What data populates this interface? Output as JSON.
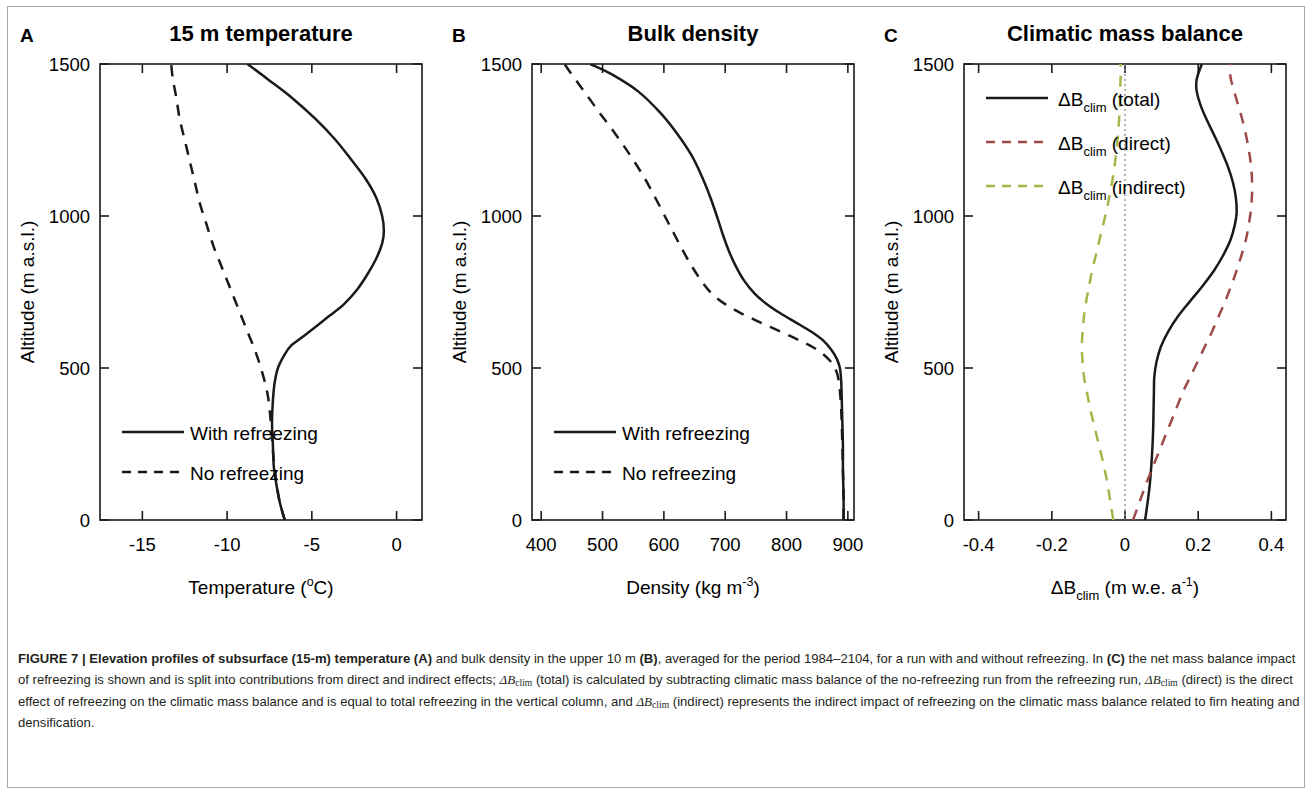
{
  "figure": {
    "label": "FIGURE 7",
    "separator": "|",
    "caption_bold": "Elevation profiles of subsurface (15-m) temperature (A)",
    "caption_rest_1": " and bulk density in the upper 10 m ",
    "caption_b_tag": "(B)",
    "caption_rest_2": ", averaged for the period 1984–2104, for a run with and without refreezing. In ",
    "caption_c_tag": "(C)",
    "caption_rest_3": " the net mass balance impact of refreezing is shown and is split into contributions from direct and indirect effects; ",
    "caption_sym_1": "ΔB",
    "caption_sub_1": "clim",
    "caption_rest_4": " (total) is calculated by subtracting climatic mass balance of the no-refreezing run from the refreezing run, ",
    "caption_sym_2": "ΔB",
    "caption_sub_2": "clim",
    "caption_rest_5": " (direct) is the direct effect of refreezing on the climatic mass balance and is equal to total refreezing in the vertical column, and ",
    "caption_sym_3": "ΔB",
    "caption_sub_3": "clim",
    "caption_rest_6": " (indirect) represents the indirect impact of refreezing on the climatic mass balance related to firn heating and densification."
  },
  "colors": {
    "curve_black": "#1a1a1a",
    "curve_red": "#9e4a4a",
    "curve_green": "#a8b44a",
    "zero_line": "#8c8c8c",
    "axis": "#1a1a1a",
    "border": "#a9a9a9"
  },
  "shared": {
    "ylabel": "Altitude (m a.s.l.)",
    "yticks": [
      0,
      500,
      1000,
      1500
    ],
    "ylim": [
      0,
      1500
    ]
  },
  "chart_data": [
    {
      "panel_letter": "A",
      "type": "line",
      "title": "15 m temperature",
      "xlabel": "Temperature (",
      "xlabel_sup": "o",
      "xlabel_tail": "C)",
      "ylabel": "Altitude (m a.s.l.)",
      "xlim": [
        -17.5,
        1.5
      ],
      "ylim": [
        0,
        1500
      ],
      "xticks": [
        -15,
        -10,
        -5,
        0
      ],
      "xtick_labels": [
        "-15",
        "-10",
        "-5",
        "0"
      ],
      "ylabel_ticks": [
        0,
        500,
        1000,
        1500
      ],
      "grid": false,
      "legend_position": "lower-left",
      "series": [
        {
          "name": "With refreezing",
          "style": "solid",
          "color": "#1a1a1a",
          "points": [
            [
              -6.6,
              0
            ],
            [
              -6.9,
              60
            ],
            [
              -7.1,
              120
            ],
            [
              -7.25,
              180
            ],
            [
              -7.3,
              250
            ],
            [
              -7.35,
              320
            ],
            [
              -7.3,
              390
            ],
            [
              -7.2,
              450
            ],
            [
              -7.0,
              500
            ],
            [
              -6.6,
              545
            ],
            [
              -6.2,
              575
            ],
            [
              -5.6,
              600
            ],
            [
              -4.9,
              630
            ],
            [
              -4.0,
              670
            ],
            [
              -3.1,
              710
            ],
            [
              -2.3,
              760
            ],
            [
              -1.7,
              810
            ],
            [
              -1.2,
              860
            ],
            [
              -0.85,
              910
            ],
            [
              -0.75,
              950
            ],
            [
              -0.85,
              1000
            ],
            [
              -1.2,
              1060
            ],
            [
              -1.8,
              1120
            ],
            [
              -2.6,
              1180
            ],
            [
              -3.6,
              1250
            ],
            [
              -4.8,
              1320
            ],
            [
              -6.2,
              1390
            ],
            [
              -7.6,
              1450
            ],
            [
              -8.8,
              1500
            ]
          ]
        },
        {
          "name": "No refreezing",
          "style": "dashed",
          "color": "#1a1a1a",
          "points": [
            [
              -6.6,
              0
            ],
            [
              -6.9,
              60
            ],
            [
              -7.1,
              130
            ],
            [
              -7.25,
              200
            ],
            [
              -7.35,
              270
            ],
            [
              -7.45,
              340
            ],
            [
              -7.6,
              410
            ],
            [
              -7.9,
              480
            ],
            [
              -8.3,
              550
            ],
            [
              -8.8,
              620
            ],
            [
              -9.3,
              690
            ],
            [
              -9.8,
              760
            ],
            [
              -10.3,
              830
            ],
            [
              -10.8,
              900
            ],
            [
              -11.2,
              970
            ],
            [
              -11.6,
              1040
            ],
            [
              -11.9,
              1110
            ],
            [
              -12.2,
              1180
            ],
            [
              -12.5,
              1250
            ],
            [
              -12.8,
              1320
            ],
            [
              -13.0,
              1390
            ],
            [
              -13.2,
              1450
            ],
            [
              -13.3,
              1500
            ]
          ]
        }
      ],
      "legend": [
        {
          "label": "With refreezing",
          "style": "solid"
        },
        {
          "label": "No refreezing",
          "style": "dashed"
        }
      ]
    },
    {
      "panel_letter": "B",
      "type": "line",
      "title": "Bulk density",
      "xlabel": "Density (kg m",
      "xlabel_sup": "-3",
      "xlabel_tail": ")",
      "ylabel": "Altitude (m a.s.l.)",
      "xlim": [
        385,
        910
      ],
      "ylim": [
        0,
        1500
      ],
      "xticks": [
        400,
        500,
        600,
        700,
        800,
        900
      ],
      "xtick_labels": [
        "400",
        "500",
        "600",
        "700",
        "800",
        "900"
      ],
      "grid": false,
      "legend_position": "lower-left",
      "series": [
        {
          "name": "With refreezing",
          "style": "solid",
          "color": "#1a1a1a",
          "points": [
            [
              893,
              0
            ],
            [
              893,
              80
            ],
            [
              892,
              160
            ],
            [
              892,
              240
            ],
            [
              891,
              320
            ],
            [
              890,
              400
            ],
            [
              889,
              460
            ],
            [
              887,
              500
            ],
            [
              882,
              530
            ],
            [
              873,
              560
            ],
            [
              860,
              590
            ],
            [
              840,
              620
            ],
            [
              815,
              650
            ],
            [
              790,
              680
            ],
            [
              768,
              710
            ],
            [
              748,
              745
            ],
            [
              730,
              790
            ],
            [
              716,
              840
            ],
            [
              705,
              890
            ],
            [
              696,
              940
            ],
            [
              688,
              990
            ],
            [
              676,
              1060
            ],
            [
              662,
              1130
            ],
            [
              645,
              1200
            ],
            [
              622,
              1270
            ],
            [
              594,
              1340
            ],
            [
              558,
              1410
            ],
            [
              516,
              1465
            ],
            [
              480,
              1500
            ]
          ]
        },
        {
          "name": "No refreezing",
          "style": "dashed",
          "color": "#1a1a1a",
          "points": [
            [
              893,
              0
            ],
            [
              893,
              80
            ],
            [
              892,
              160
            ],
            [
              891,
              240
            ],
            [
              890,
              320
            ],
            [
              888,
              400
            ],
            [
              885,
              460
            ],
            [
              879,
              500
            ],
            [
              868,
              530
            ],
            [
              850,
              560
            ],
            [
              822,
              590
            ],
            [
              790,
              620
            ],
            [
              757,
              650
            ],
            [
              726,
              680
            ],
            [
              700,
              710
            ],
            [
              678,
              745
            ],
            [
              660,
              790
            ],
            [
              644,
              840
            ],
            [
              630,
              890
            ],
            [
              617,
              940
            ],
            [
              604,
              990
            ],
            [
              586,
              1060
            ],
            [
              567,
              1130
            ],
            [
              545,
              1200
            ],
            [
              521,
              1270
            ],
            [
              495,
              1340
            ],
            [
              470,
              1410
            ],
            [
              450,
              1465
            ],
            [
              438,
              1500
            ]
          ]
        }
      ],
      "legend": [
        {
          "label": "With refreezing",
          "style": "solid"
        },
        {
          "label": "No refreezing",
          "style": "dashed"
        }
      ]
    },
    {
      "panel_letter": "C",
      "type": "line",
      "title": "Climatic mass balance",
      "xlabel_sym": "ΔB",
      "xlabel_sub": "clim",
      "xlabel_unit": " (m w.e. a",
      "xlabel_sup": "-1",
      "xlabel_tail": ")",
      "ylabel": "Altitude (m a.s.l.)",
      "xlim": [
        -0.44,
        0.44
      ],
      "ylim": [
        0,
        1500
      ],
      "xticks": [
        -0.4,
        -0.2,
        0,
        0.2,
        0.4
      ],
      "xtick_labels": [
        "-0.4",
        "-0.2",
        "0",
        "0.2",
        "0.4"
      ],
      "grid": false,
      "zero_line": 0,
      "legend_position": "upper-left",
      "series": [
        {
          "name": "ΔBclim (total)",
          "style": "solid",
          "color": "#1a1a1a",
          "points": [
            [
              0.055,
              0
            ],
            [
              0.062,
              60
            ],
            [
              0.068,
              120
            ],
            [
              0.072,
              180
            ],
            [
              0.075,
              240
            ],
            [
              0.077,
              300
            ],
            [
              0.078,
              360
            ],
            [
              0.079,
              420
            ],
            [
              0.08,
              470
            ],
            [
              0.086,
              520
            ],
            [
              0.098,
              570
            ],
            [
              0.118,
              620
            ],
            [
              0.145,
              670
            ],
            [
              0.178,
              720
            ],
            [
              0.212,
              770
            ],
            [
              0.243,
              820
            ],
            [
              0.268,
              870
            ],
            [
              0.288,
              920
            ],
            [
              0.3,
              970
            ],
            [
              0.305,
              1010
            ],
            [
              0.303,
              1060
            ],
            [
              0.295,
              1110
            ],
            [
              0.282,
              1160
            ],
            [
              0.265,
              1210
            ],
            [
              0.246,
              1260
            ],
            [
              0.226,
              1310
            ],
            [
              0.208,
              1360
            ],
            [
              0.196,
              1410
            ],
            [
              0.196,
              1450
            ],
            [
              0.21,
              1500
            ]
          ]
        },
        {
          "name": "ΔBclim (direct)",
          "style": "dashed",
          "color": "#9e4a4a",
          "points": [
            [
              0.022,
              0
            ],
            [
              0.04,
              60
            ],
            [
              0.058,
              120
            ],
            [
              0.078,
              180
            ],
            [
              0.098,
              240
            ],
            [
              0.118,
              300
            ],
            [
              0.138,
              360
            ],
            [
              0.158,
              420
            ],
            [
              0.178,
              470
            ],
            [
              0.198,
              520
            ],
            [
              0.218,
              570
            ],
            [
              0.238,
              620
            ],
            [
              0.256,
              670
            ],
            [
              0.274,
              720
            ],
            [
              0.29,
              770
            ],
            [
              0.305,
              820
            ],
            [
              0.318,
              870
            ],
            [
              0.33,
              920
            ],
            [
              0.338,
              970
            ],
            [
              0.344,
              1020
            ],
            [
              0.347,
              1070
            ],
            [
              0.347,
              1120
            ],
            [
              0.344,
              1170
            ],
            [
              0.338,
              1220
            ],
            [
              0.33,
              1270
            ],
            [
              0.32,
              1320
            ],
            [
              0.308,
              1370
            ],
            [
              0.296,
              1420
            ],
            [
              0.288,
              1460
            ],
            [
              0.29,
              1500
            ]
          ]
        },
        {
          "name": "ΔBclim (indirect)",
          "style": "dashed",
          "color": "#a8b44a",
          "points": [
            [
              -0.032,
              0
            ],
            [
              -0.04,
              60
            ],
            [
              -0.048,
              120
            ],
            [
              -0.058,
              180
            ],
            [
              -0.07,
              240
            ],
            [
              -0.082,
              300
            ],
            [
              -0.094,
              360
            ],
            [
              -0.104,
              420
            ],
            [
              -0.112,
              470
            ],
            [
              -0.116,
              520
            ],
            [
              -0.118,
              570
            ],
            [
              -0.116,
              620
            ],
            [
              -0.112,
              670
            ],
            [
              -0.106,
              720
            ],
            [
              -0.098,
              770
            ],
            [
              -0.09,
              820
            ],
            [
              -0.08,
              870
            ],
            [
              -0.07,
              920
            ],
            [
              -0.06,
              970
            ],
            [
              -0.05,
              1020
            ],
            [
              -0.042,
              1070
            ],
            [
              -0.034,
              1120
            ],
            [
              -0.028,
              1170
            ],
            [
              -0.023,
              1220
            ],
            [
              -0.019,
              1270
            ],
            [
              -0.016,
              1320
            ],
            [
              -0.014,
              1370
            ],
            [
              -0.013,
              1420
            ],
            [
              -0.012,
              1460
            ],
            [
              -0.012,
              1500
            ]
          ]
        }
      ],
      "legend": [
        {
          "label_sym": "ΔB",
          "label_sub": "clim",
          "label_tail": " (total)",
          "style": "solid",
          "color": "#1a1a1a"
        },
        {
          "label_sym": "ΔB",
          "label_sub": "clim",
          "label_tail": " (direct)",
          "style": "dashed",
          "color": "#9e4a4a"
        },
        {
          "label_sym": "ΔB",
          "label_sub": "clim",
          "label_tail": " (indirect)",
          "style": "dashed",
          "color": "#a8b44a"
        }
      ]
    }
  ]
}
